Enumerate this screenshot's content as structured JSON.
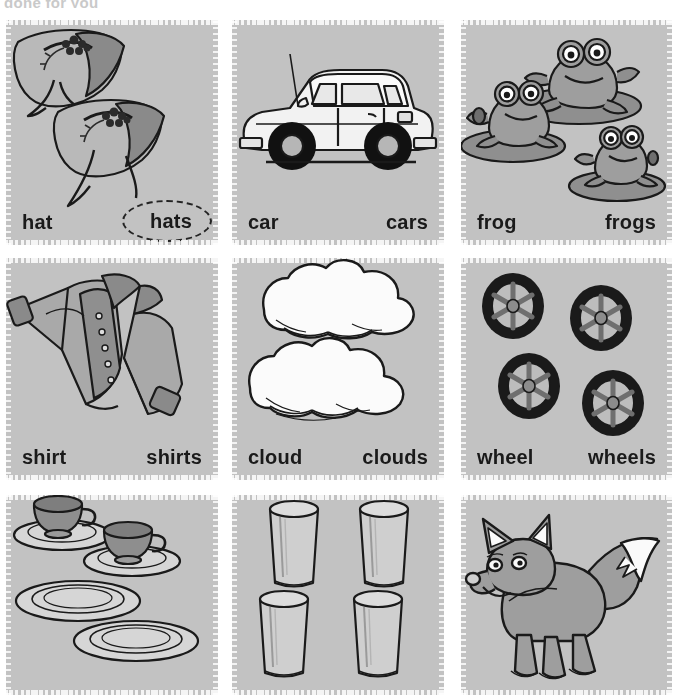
{
  "header": {
    "cutoff_text": "done for you"
  },
  "theme": {
    "card_bg": "#c2c2c2",
    "page_bg": "#ffffff",
    "label_color": "#1a1a1a",
    "ink": "#1a1a1a",
    "circle_color": "#232323"
  },
  "worksheet": {
    "type": "singular-plural-picture-cards",
    "columns": 3,
    "rows": 3,
    "cards": [
      {
        "id": "hat",
        "icon": "hat-illustration",
        "singular": "hat",
        "plural": "hats",
        "plural_circled": true,
        "labels_visible": true
      },
      {
        "id": "car",
        "icon": "car-illustration",
        "singular": "car",
        "plural": "cars",
        "plural_circled": false,
        "labels_visible": true
      },
      {
        "id": "frog",
        "icon": "frog-illustration",
        "singular": "frog",
        "plural": "frogs",
        "plural_circled": false,
        "labels_visible": true
      },
      {
        "id": "shirt",
        "icon": "shirt-illustration",
        "singular": "shirt",
        "plural": "shirts",
        "plural_circled": false,
        "labels_visible": true
      },
      {
        "id": "cloud",
        "icon": "cloud-illustration",
        "singular": "cloud",
        "plural": "clouds",
        "plural_circled": false,
        "labels_visible": true
      },
      {
        "id": "wheel",
        "icon": "wheel-illustration",
        "singular": "wheel",
        "plural": "wheels",
        "plural_circled": false,
        "labels_visible": true
      },
      {
        "id": "cup",
        "icon": "cup-and-plate-illustration",
        "singular": "",
        "plural": "",
        "plural_circled": false,
        "labels_visible": false
      },
      {
        "id": "glass",
        "icon": "glass-illustration",
        "singular": "",
        "plural": "",
        "plural_circled": false,
        "labels_visible": false
      },
      {
        "id": "fox",
        "icon": "fox-illustration",
        "singular": "",
        "plural": "",
        "plural_circled": false,
        "labels_visible": false
      }
    ]
  }
}
